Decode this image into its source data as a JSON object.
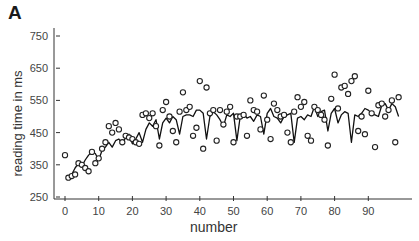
{
  "panel_label": "A",
  "chart_data": {
    "type": "scatter",
    "title": "",
    "panel": "A",
    "xlabel": "number",
    "ylabel": "reading time in ms",
    "xlim": [
      0,
      100
    ],
    "ylim": [
      250,
      750
    ],
    "xticks": [
      0,
      10,
      20,
      30,
      40,
      50,
      60,
      70,
      80,
      90
    ],
    "yticks": [
      250,
      350,
      450,
      550,
      650,
      750
    ],
    "grid": false,
    "legend": null,
    "series": [
      {
        "name": "observed",
        "style": "open-circle",
        "x": [
          0,
          1,
          2,
          3,
          4,
          5,
          6,
          7,
          8,
          9,
          10,
          11,
          12,
          13,
          14,
          15,
          16,
          17,
          18,
          19,
          20,
          21,
          22,
          23,
          24,
          25,
          26,
          27,
          28,
          29,
          30,
          31,
          32,
          33,
          34,
          35,
          36,
          37,
          38,
          39,
          40,
          41,
          42,
          43,
          44,
          45,
          46,
          47,
          48,
          49,
          50,
          51,
          52,
          53,
          54,
          55,
          56,
          57,
          58,
          59,
          60,
          61,
          62,
          63,
          64,
          65,
          66,
          67,
          68,
          69,
          70,
          71,
          72,
          73,
          74,
          75,
          76,
          77,
          78,
          79,
          80,
          81,
          82,
          83,
          84,
          85,
          86,
          87,
          88,
          89,
          90,
          91,
          92,
          93,
          94,
          95,
          96,
          97,
          98,
          99
        ],
        "values": [
          380,
          310,
          315,
          320,
          355,
          350,
          340,
          330,
          390,
          355,
          370,
          400,
          420,
          470,
          450,
          480,
          460,
          420,
          440,
          435,
          430,
          420,
          415,
          505,
          510,
          495,
          510,
          470,
          410,
          520,
          545,
          500,
          455,
          420,
          515,
          575,
          520,
          530,
          440,
          465,
          610,
          400,
          590,
          510,
          520,
          425,
          520,
          475,
          515,
          530,
          420,
          500,
          500,
          505,
          440,
          550,
          520,
          515,
          460,
          565,
          490,
          430,
          540,
          520,
          500,
          505,
          450,
          420,
          515,
          560,
          530,
          545,
          440,
          425,
          530,
          520,
          505,
          490,
          410,
          555,
          630,
          525,
          590,
          595,
          570,
          610,
          625,
          455,
          500,
          445,
          580,
          510,
          405,
          535,
          540,
          500,
          520,
          550,
          420,
          560
        ]
      },
      {
        "name": "model",
        "style": "line",
        "x": [
          1,
          2,
          3,
          4,
          5,
          6,
          7,
          8,
          9,
          10,
          11,
          12,
          13,
          14,
          15,
          16,
          17,
          18,
          19,
          20,
          21,
          22,
          23,
          24,
          25,
          26,
          27,
          28,
          29,
          30,
          31,
          32,
          33,
          34,
          35,
          36,
          37,
          38,
          39,
          40,
          41,
          42,
          43,
          44,
          45,
          46,
          47,
          48,
          49,
          50,
          51,
          52,
          53,
          54,
          55,
          56,
          57,
          58,
          59,
          60,
          61,
          62,
          63,
          64,
          65,
          66,
          67,
          68,
          69,
          70,
          71,
          72,
          73,
          74,
          75,
          76,
          77,
          78,
          79,
          80,
          81,
          82,
          83,
          84,
          85,
          86,
          87,
          88,
          89,
          90,
          91,
          92,
          93,
          94,
          95,
          96,
          97,
          98,
          99
        ],
        "values": [
          310,
          320,
          340,
          355,
          345,
          365,
          380,
          390,
          385,
          365,
          395,
          405,
          420,
          405,
          425,
          430,
          415,
          435,
          445,
          415,
          430,
          450,
          420,
          460,
          480,
          470,
          490,
          430,
          480,
          495,
          480,
          500,
          490,
          445,
          500,
          505,
          505,
          500,
          520,
          520,
          510,
          430,
          500,
          515,
          505,
          490,
          470,
          505,
          500,
          510,
          425,
          500,
          510,
          495,
          500,
          485,
          505,
          500,
          445,
          510,
          525,
          500,
          495,
          480,
          500,
          505,
          510,
          420,
          495,
          500,
          490,
          505,
          500,
          530,
          500,
          515,
          520,
          455,
          510,
          525,
          480,
          505,
          515,
          510,
          420,
          505,
          500,
          510,
          525,
          520,
          510,
          505,
          500,
          535,
          540,
          520,
          540,
          530,
          500
        ]
      }
    ]
  }
}
